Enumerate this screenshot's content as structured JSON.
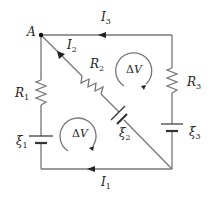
{
  "diagram": {
    "type": "circuit",
    "colors": {
      "wire": "#777777",
      "text": "#222222",
      "node": "#111111"
    },
    "node": {
      "label": "A"
    },
    "currents": [
      {
        "id": "I1",
        "base": "I",
        "sub": "1"
      },
      {
        "id": "I2",
        "base": "I",
        "sub": "2"
      },
      {
        "id": "I3",
        "base": "I",
        "sub": "3"
      }
    ],
    "resistors": [
      {
        "id": "R1",
        "base": "R",
        "sub": "1"
      },
      {
        "id": "R2",
        "base": "R",
        "sub": "2"
      },
      {
        "id": "R3",
        "base": "R",
        "sub": "3"
      }
    ],
    "emfs": [
      {
        "id": "xi1",
        "base": "ξ",
        "sub": "1"
      },
      {
        "id": "xi2",
        "base": "ξ",
        "sub": "2"
      },
      {
        "id": "xi3",
        "base": "ξ",
        "sub": "3"
      }
    ],
    "loops": [
      {
        "id": "upper",
        "delta": "Δ",
        "var": "V",
        "direction": "clockwise"
      },
      {
        "id": "lower",
        "delta": "Δ",
        "var": "V",
        "direction": "clockwise"
      }
    ]
  }
}
